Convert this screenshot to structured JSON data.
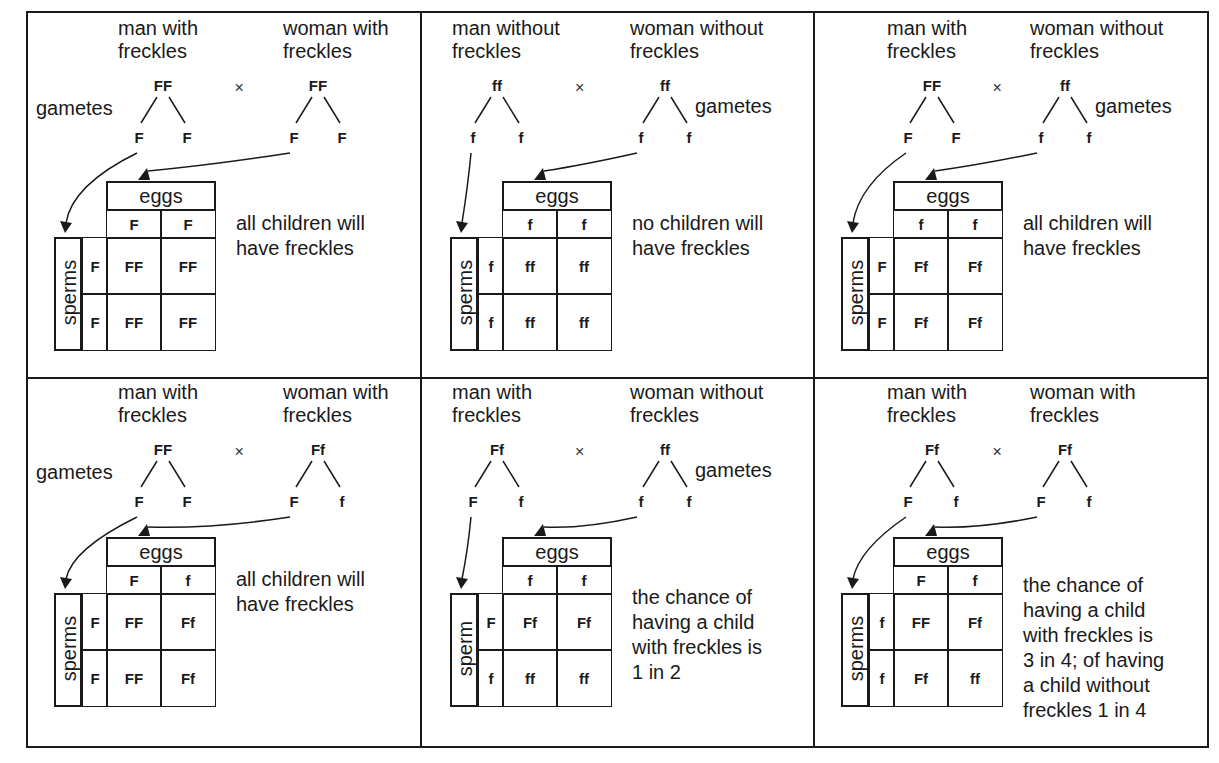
{
  "diagram": {
    "labels": {
      "gametes": "gametes",
      "eggs": "eggs",
      "cross_symbol": "×"
    },
    "panels": [
      {
        "father_label": [
          "man with",
          "freckles"
        ],
        "mother_label": [
          "woman with",
          "freckles"
        ],
        "father_genotype": "FF",
        "mother_genotype": "FF",
        "father_gametes": [
          "F",
          "F"
        ],
        "mother_gametes": [
          "F",
          "F"
        ],
        "sperm_label": "sperms",
        "egg_alleles": [
          "F",
          "F"
        ],
        "sperm_alleles": [
          "F",
          "F"
        ],
        "offspring": [
          [
            "FF",
            "FF"
          ],
          [
            "FF",
            "FF"
          ]
        ],
        "conclusion": [
          "all children will",
          "have freckles"
        ],
        "gametes_side": "left"
      },
      {
        "father_label": [
          "man without",
          "freckles"
        ],
        "mother_label": [
          "woman without",
          "freckles"
        ],
        "father_genotype": "ff",
        "mother_genotype": "ff",
        "father_gametes": [
          "f",
          "f"
        ],
        "mother_gametes": [
          "f",
          "f"
        ],
        "sperm_label": "sperms",
        "egg_alleles": [
          "f",
          "f"
        ],
        "sperm_alleles": [
          "f",
          "f"
        ],
        "offspring": [
          [
            "ff",
            "ff"
          ],
          [
            "ff",
            "ff"
          ]
        ],
        "conclusion": [
          "no children will",
          "have freckles"
        ],
        "gametes_side": "right"
      },
      {
        "father_label": [
          "man with",
          "freckles"
        ],
        "mother_label": [
          "woman without",
          "freckles"
        ],
        "father_genotype": "FF",
        "mother_genotype": "ff",
        "father_gametes": [
          "F",
          "F"
        ],
        "mother_gametes": [
          "f",
          "f"
        ],
        "sperm_label": "sperms",
        "egg_alleles": [
          "f",
          "f"
        ],
        "sperm_alleles": [
          "F",
          "F"
        ],
        "offspring": [
          [
            "Ff",
            "Ff"
          ],
          [
            "Ff",
            "Ff"
          ]
        ],
        "conclusion": [
          "all children will",
          "have freckles"
        ],
        "gametes_side": "right"
      },
      {
        "father_label": [
          "man with",
          "freckles"
        ],
        "mother_label": [
          "woman with",
          "freckles"
        ],
        "father_genotype": "FF",
        "mother_genotype": "Ff",
        "father_gametes": [
          "F",
          "F"
        ],
        "mother_gametes": [
          "F",
          "f"
        ],
        "sperm_label": "sperms",
        "egg_alleles": [
          "F",
          "f"
        ],
        "sperm_alleles": [
          "F",
          "F"
        ],
        "offspring": [
          [
            "FF",
            "Ff"
          ],
          [
            "FF",
            "Ff"
          ]
        ],
        "conclusion": [
          "all children will",
          "have freckles"
        ],
        "gametes_side": "left"
      },
      {
        "father_label": [
          "man with",
          "freckles"
        ],
        "mother_label": [
          "woman without",
          "freckles"
        ],
        "father_genotype": "Ff",
        "mother_genotype": "ff",
        "father_gametes": [
          "F",
          "f"
        ],
        "mother_gametes": [
          "f",
          "f"
        ],
        "sperm_label": "sperm",
        "egg_alleles": [
          "f",
          "f"
        ],
        "sperm_alleles": [
          "F",
          "f"
        ],
        "offspring": [
          [
            "Ff",
            "Ff"
          ],
          [
            "ff",
            "ff"
          ]
        ],
        "conclusion": [
          "the chance of",
          "having a child",
          "with freckles is",
          "1 in 2"
        ],
        "gametes_side": "right"
      },
      {
        "father_label": [
          "man with",
          "freckles"
        ],
        "mother_label": [
          "woman with",
          "freckles"
        ],
        "father_genotype": "Ff",
        "mother_genotype": "Ff",
        "father_gametes": [
          "F",
          "f"
        ],
        "mother_gametes": [
          "F",
          "f"
        ],
        "sperm_label": "sperms",
        "egg_alleles": [
          "F",
          "f"
        ],
        "sperm_alleles": [
          "f",
          "f"
        ],
        "offspring": [
          [
            "FF",
            "Ff"
          ],
          [
            "Ff",
            "ff"
          ]
        ],
        "conclusion": [
          "the chance of",
          "having a child",
          "with freckles is",
          "3 in 4; of having",
          "a child without",
          "freckles 1 in 4"
        ],
        "gametes_side": "none"
      }
    ]
  }
}
